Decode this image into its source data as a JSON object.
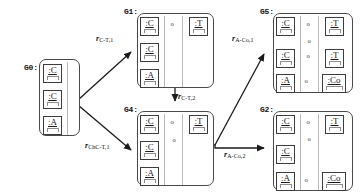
{
  "diagram": {
    "background": "#ffffff",
    "stroke": "#3d3d3d",
    "lane_color": "#b9b9b9"
  },
  "graphs": [
    {
      "id": "G0",
      "label": "G0:",
      "nodes": [
        {
          "id": "g0-c1",
          "text": ":C"
        },
        {
          "id": "g0-c2",
          "text": ":C"
        },
        {
          "id": "g0-a",
          "text": ":A"
        }
      ]
    },
    {
      "id": "G1",
      "label": "G1:",
      "nodes": [
        {
          "id": "g1-c1",
          "text": ":C"
        },
        {
          "id": "g1-c2",
          "text": ":C"
        },
        {
          "id": "g1-a",
          "text": ":A"
        },
        {
          "id": "g1-t1",
          "text": ":T"
        }
      ]
    },
    {
      "id": "G4",
      "label": "G4:",
      "nodes": [
        {
          "id": "g4-c1",
          "text": ":C"
        },
        {
          "id": "g4-c2",
          "text": ":C"
        },
        {
          "id": "g4-a",
          "text": ":A"
        },
        {
          "id": "g4-t1",
          "text": ":T"
        }
      ]
    },
    {
      "id": "G5",
      "label": "G5:",
      "nodes": [
        {
          "id": "g5-c1",
          "text": ":C"
        },
        {
          "id": "g5-c2",
          "text": ":C"
        },
        {
          "id": "g5-a",
          "text": ":A"
        },
        {
          "id": "g5-t1",
          "text": ":T"
        },
        {
          "id": "g5-t2",
          "text": ":T"
        },
        {
          "id": "g5-co",
          "text": ":Co"
        }
      ]
    },
    {
      "id": "G2",
      "label": "G2:",
      "nodes": [
        {
          "id": "g2-c1",
          "text": ":C"
        },
        {
          "id": "g2-c2",
          "text": ":C"
        },
        {
          "id": "g2-a",
          "text": ":A"
        },
        {
          "id": "g2-t1",
          "text": ":T"
        },
        {
          "id": "g2-co",
          "text": ":Co"
        }
      ]
    }
  ],
  "rules": [
    {
      "id": "r-c-t-1",
      "var": "r",
      "sub": "C-T,1",
      "full": "r C-T,1"
    },
    {
      "id": "r-chc-t-1",
      "var": "r",
      "sub": "ChC-T,1",
      "full": "r ChC-T,1"
    },
    {
      "id": "r-c-t-2",
      "var": "r",
      "sub": "C-T,2",
      "full": "r C-T,2"
    },
    {
      "id": "r-a-co-1",
      "var": "r",
      "sub": "A-Co,1",
      "full": "r A-Co,1"
    },
    {
      "id": "r-a-co-2",
      "var": "r",
      "sub": "A-Co,2",
      "full": "r A-Co,2"
    }
  ],
  "markers": {
    "association_marker": "o"
  },
  "edge_kinds": {
    "generalization": "hollow-triangle",
    "association": "dashed-double-arrow",
    "link": "solid-line",
    "transformation": "solid-arrow"
  }
}
